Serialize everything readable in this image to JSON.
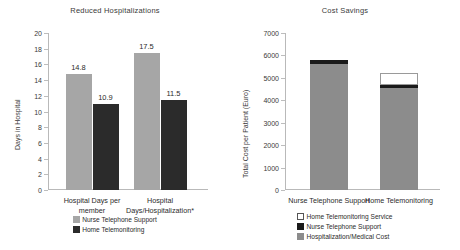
{
  "chart_data": [
    {
      "type": "bar",
      "title": "Reduced Hospitalizations",
      "xlabel": "",
      "ylabel": "Days in Hospital",
      "ylim": [
        0,
        20
      ],
      "ytick_step": 2,
      "yticks": [
        "20",
        "18",
        "16",
        "14",
        "12",
        "10",
        "8",
        "6",
        "4",
        "2",
        "0"
      ],
      "grid": false,
      "legend_position": "bottom",
      "categories": [
        "Hospital Days per member",
        "Hospital Days/Hospitalization*"
      ],
      "series": [
        {
          "name": "Nurse Telephone Support",
          "color": "#a6a6a6",
          "values": [
            14.8,
            17.5
          ],
          "labels": [
            "14.8",
            "17.5"
          ]
        },
        {
          "name": "Home Telemonitoring",
          "color": "#2b2b2b",
          "values": [
            10.9,
            11.5
          ],
          "labels": [
            "10.9",
            "11.5"
          ]
        }
      ]
    },
    {
      "type": "bar",
      "subtype": "stacked",
      "title": "Cost Savings",
      "xlabel": "",
      "ylabel": "Total Cost per Patient (Euro)",
      "ylim": [
        0,
        7000
      ],
      "ytick_step": 1000,
      "yticks": [
        "7000",
        "6000",
        "5000",
        "4000",
        "3000",
        "2000",
        "1000",
        "0"
      ],
      "grid": false,
      "legend_position": "bottom",
      "categories": [
        "Nurse Telephone Support",
        "Home Telemonitoring"
      ],
      "series": [
        {
          "name": "Hospitalization/Medical Cost",
          "color": "#8c8c8c",
          "values": [
            5600,
            4550
          ]
        },
        {
          "name": "Nurse Telephone Support",
          "color": "#1a1a1a",
          "values": [
            200,
            120
          ]
        },
        {
          "name": "Home Telemonitoring Service",
          "color": "#ffffff",
          "values": [
            0,
            550
          ]
        }
      ],
      "totals": [
        5800,
        5220
      ]
    }
  ],
  "left_panel": {
    "title": "Reduced Hospitalizations",
    "ylabel": "Days in Hospital",
    "yticks": [
      "20",
      "18",
      "16",
      "14",
      "12",
      "10",
      "8",
      "6",
      "4",
      "2",
      "0"
    ],
    "categories": [
      "Hospital Days per member",
      "Hospital Days/Hospitalization*"
    ],
    "bars": [
      {
        "label": "14.8",
        "value": 14.8,
        "series": "Nurse Telephone Support"
      },
      {
        "label": "10.9",
        "value": 10.9,
        "series": "Home Telemonitoring"
      },
      {
        "label": "17.5",
        "value": 17.5,
        "series": "Nurse Telephone Support"
      },
      {
        "label": "11.5",
        "value": 11.5,
        "series": "Home Telemonitoring"
      }
    ],
    "legend": [
      {
        "label": "Nurse Telephone Support",
        "color": "#a6a6a6"
      },
      {
        "label": "Home Telemonitoring",
        "color": "#2b2b2b"
      }
    ]
  },
  "right_panel": {
    "title": "Cost Savings",
    "ylabel": "Total Cost per Patient (Euro)",
    "yticks": [
      "7000",
      "6000",
      "5000",
      "4000",
      "3000",
      "2000",
      "1000",
      "0"
    ],
    "categories": [
      "Nurse Telephone Support",
      "Home Telemonitoring"
    ],
    "legend": [
      {
        "label": "Home Telemonitoring Service",
        "color": "#ffffff"
      },
      {
        "label": "Nurse Telephone Support",
        "color": "#1a1a1a"
      },
      {
        "label": "Hospitalization/Medical Cost",
        "color": "#8c8c8c"
      }
    ]
  }
}
